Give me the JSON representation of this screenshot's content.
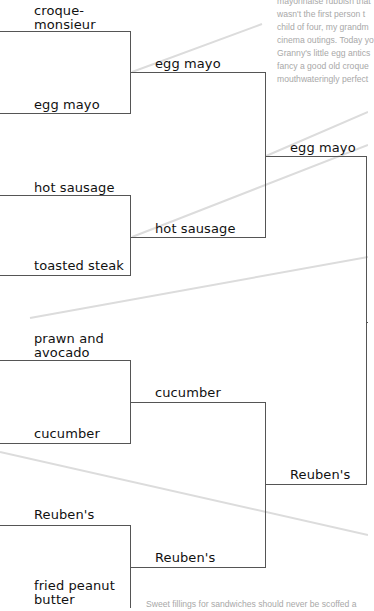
{
  "bracket": {
    "round1": [
      {
        "top": "croque-\nmonsieur",
        "top_line1": "croque-",
        "top_line2": "monsieur",
        "bottom": "egg mayo"
      },
      {
        "top": "hot sausage",
        "bottom": "toasted steak"
      },
      {
        "top_line1": "prawn and",
        "top_line2": "avocado",
        "bottom": "cucumber"
      },
      {
        "top": "Reuben's",
        "bottom_line1": "fried peanut",
        "bottom_line2": "butter"
      }
    ],
    "round2": [
      {
        "winner": "egg mayo"
      },
      {
        "winner": "hot sausage"
      },
      {
        "winner": "cucumber"
      },
      {
        "winner": "Reuben's"
      }
    ],
    "round3": [
      {
        "winner": "egg mayo"
      },
      {
        "winner": "Reuben's"
      }
    ]
  },
  "notes": {
    "top_lines": [
      "mayonnaise rubbish that",
      "wasn't the first person t",
      "child of four, my grandm",
      "cinema outings. Today yo",
      "Granny's little egg antics",
      "fancy a good old croque",
      "mouthwateringly perfect"
    ],
    "bottom_line": "Sweet fillings for sandwiches should never be scoffed a"
  },
  "colors": {
    "bracket_line": "#555555",
    "label_text": "#111111",
    "note_text": "#a8a8a8",
    "guide_line": "#d8d8d8"
  }
}
